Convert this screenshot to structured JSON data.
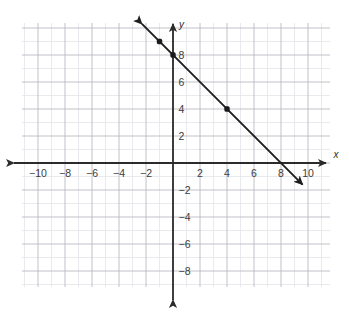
{
  "figure": {
    "kind": "coordinate-plane-line-graph",
    "background_color": "#ffffff",
    "axis_color": "#2b2b2b",
    "grid_major_color": "#b9b9c4",
    "grid_minor_color": "#e3e3ea",
    "line_color": "#1e1e1e",
    "point_color": "#1a1a1a"
  },
  "axes": {
    "x_axis_name": "x",
    "y_axis_name": "y",
    "x_tick_labels": [
      "−10",
      "−8",
      "−6",
      "−4",
      "−2",
      "2",
      "4",
      "6",
      "8",
      "10"
    ],
    "y_tick_labels": [
      "8",
      "6",
      "4",
      "2",
      "−2",
      "−4",
      "−6",
      "−8"
    ],
    "x_tick_values": [
      -10,
      -8,
      -6,
      -4,
      -2,
      2,
      4,
      6,
      8,
      10
    ],
    "y_tick_values": [
      8,
      6,
      4,
      2,
      -2,
      -4,
      -6,
      -8
    ],
    "x_arrow_left": true,
    "x_arrow_right": true,
    "y_arrow_up": true,
    "y_arrow_down": true
  },
  "chart_data": {
    "type": "line",
    "title": "",
    "subtitle": "",
    "xlabel": "x",
    "ylabel": "y",
    "xlim": [
      -11.2,
      11.6
    ],
    "ylim": [
      -10.3,
      10.4
    ],
    "grid": true,
    "grid_major_step": 2,
    "grid_minor_step": 1,
    "legend": false,
    "legend_position": "none",
    "series": [
      {
        "name": "line",
        "equation": "y = -x + 8",
        "slope": -1,
        "y_intercept": 8,
        "x_intercept": 8,
        "style": "solid-double-arrow",
        "endpoints": [
          {
            "x": -2.3,
            "y": 10.3
          },
          {
            "x": 9.6,
            "y": -1.6
          }
        ],
        "marked_points": [
          {
            "x": -1,
            "y": 9
          },
          {
            "x": 0,
            "y": 8
          },
          {
            "x": 4,
            "y": 4
          }
        ]
      }
    ],
    "annotations": []
  }
}
